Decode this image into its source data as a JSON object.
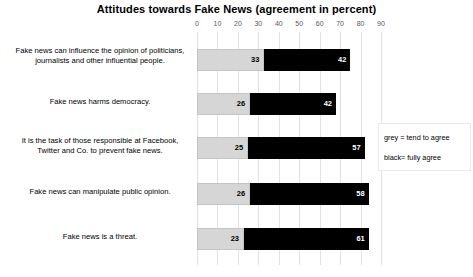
{
  "chart_data": {
    "type": "bar",
    "orientation": "horizontal",
    "stacked": true,
    "title": "Attitudes towards Fake News (agreement in percent)",
    "xlabel": "",
    "ylabel": "",
    "xlim": [
      0,
      90
    ],
    "xticks": [
      0,
      10,
      20,
      30,
      40,
      50,
      60,
      70,
      80,
      90
    ],
    "grid": true,
    "legend_position": "right",
    "categories": [
      "Fake news can influence the opinion of politicians, journalists and other influential people.",
      "Fake news harms democracy.",
      "It is the task of those responsible at Facebook, Twitter and Co. to prevent fake news.",
      "Fake news can manipulate public opinion.",
      "Fake news is a threat."
    ],
    "series": [
      {
        "name": "grey = tend to agree",
        "color": "#d6d6d6",
        "values": [
          33,
          26,
          25,
          26,
          23
        ]
      },
      {
        "name": "black= fully agree",
        "color": "#000000",
        "values": [
          42,
          42,
          57,
          58,
          61
        ]
      }
    ],
    "totals": [
      75,
      68,
      82,
      84,
      84
    ]
  },
  "legend": {
    "grey_label": "grey = tend to agree",
    "black_label": "black= fully agree"
  }
}
